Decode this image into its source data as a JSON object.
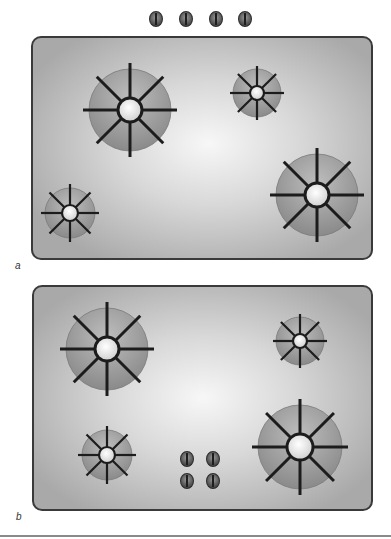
{
  "colors": {
    "panel_fill_edge": "#a9a9a9",
    "panel_fill_highlight": "#f7f7f7",
    "panel_border": "#3a3a3a",
    "burner_edge": "#8a8a8a",
    "burner_inner": "#bdbdbd",
    "grate": "#1c1c1c",
    "cap": "#f4f4f4"
  },
  "figure_a": {
    "label": "a",
    "panel": {
      "left": 31,
      "top": 36,
      "width": 342,
      "height": 224,
      "highlight": [
        52,
        48
      ]
    },
    "knobs": [
      {
        "cx": 156,
        "cy": 19
      },
      {
        "cx": 186,
        "cy": 19
      },
      {
        "cx": 216,
        "cy": 19
      },
      {
        "cx": 245,
        "cy": 19
      }
    ],
    "burners": [
      {
        "name": "large-top-left",
        "cx": 130,
        "cy": 110,
        "r": 41
      },
      {
        "name": "small-top-right",
        "cx": 257,
        "cy": 93,
        "r": 24
      },
      {
        "name": "small-bottom-left",
        "cx": 70,
        "cy": 213,
        "r": 25
      },
      {
        "name": "large-bottom-right",
        "cx": 317,
        "cy": 195,
        "r": 41
      }
    ]
  },
  "figure_b": {
    "label": "b",
    "panel": {
      "left": 32,
      "top": 285,
      "width": 341,
      "height": 226,
      "highlight": [
        50,
        50
      ]
    },
    "knobs": [
      {
        "cx": 187,
        "cy": 459
      },
      {
        "cx": 213,
        "cy": 459
      },
      {
        "cx": 187,
        "cy": 481
      },
      {
        "cx": 213,
        "cy": 481
      }
    ],
    "burners": [
      {
        "name": "large-top-left",
        "cx": 107,
        "cy": 349,
        "r": 41
      },
      {
        "name": "small-top-right",
        "cx": 300,
        "cy": 341,
        "r": 24
      },
      {
        "name": "small-bottom-left",
        "cx": 107,
        "cy": 455,
        "r": 25
      },
      {
        "name": "large-bottom-right",
        "cx": 300,
        "cy": 447,
        "r": 42
      }
    ]
  }
}
